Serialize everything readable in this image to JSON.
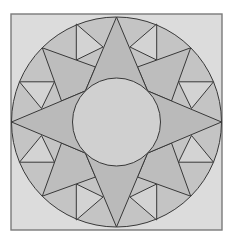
{
  "diagram": {
    "colors": {
      "page_background": "#ffffff",
      "square_fill": "#dcdcdc",
      "square_border": "#7a7a7a",
      "outer_ring_fill": "#c4c4c4",
      "star_point_fill": "#bababa",
      "secondary_point_fill": "#bdbdbd",
      "tertiary_point_fill": "#d3d3d3",
      "center_circle_fill": "#d0d0d0",
      "line": "#383838"
    },
    "square": {
      "x": 11,
      "y": 14,
      "width": 211,
      "height": 216
    },
    "outer_circle": {
      "cx": 116.5,
      "cy": 122,
      "r": 105
    },
    "center_circle": {
      "cx": 116.5,
      "cy": 122,
      "r": 44
    },
    "main_points": [
      {
        "name": "north",
        "points": [
          [
            116.5,
            17
          ],
          [
            147.6,
            90.9
          ],
          [
            85.4,
            90.9
          ]
        ]
      },
      {
        "name": "east",
        "points": [
          [
            221.5,
            122
          ],
          [
            147.6,
            153.1
          ],
          [
            147.6,
            90.9
          ]
        ]
      },
      {
        "name": "south",
        "points": [
          [
            116.5,
            227
          ],
          [
            85.4,
            153.1
          ],
          [
            147.6,
            153.1
          ]
        ]
      },
      {
        "name": "west",
        "points": [
          [
            11.5,
            122
          ],
          [
            85.4,
            90.9
          ],
          [
            85.4,
            153.1
          ]
        ]
      }
    ],
    "secondary_points": [
      {
        "name": "northwest",
        "points": [
          [
            42.3,
            47.8
          ],
          [
            95.5,
            67
          ],
          [
            85.4,
            90.9
          ],
          [
            61.5,
            101
          ]
        ]
      },
      {
        "name": "northeast",
        "points": [
          [
            190.7,
            47.8
          ],
          [
            137.5,
            67
          ],
          [
            147.6,
            90.9
          ],
          [
            171.5,
            101
          ]
        ]
      },
      {
        "name": "southwest",
        "points": [
          [
            42.3,
            196.2
          ],
          [
            95.5,
            177
          ],
          [
            85.4,
            153.1
          ],
          [
            61.5,
            143
          ]
        ]
      },
      {
        "name": "southeast",
        "points": [
          [
            190.7,
            196.2
          ],
          [
            137.5,
            177
          ],
          [
            147.6,
            153.1
          ],
          [
            171.5,
            143
          ]
        ]
      }
    ],
    "tertiary_points": [
      {
        "name": "north-northwest",
        "points": [
          [
            76.3,
            24
          ],
          [
            76.3,
            60
          ],
          [
            103,
            47
          ]
        ]
      },
      {
        "name": "north-northeast",
        "points": [
          [
            156.7,
            24
          ],
          [
            156.7,
            60
          ],
          [
            130,
            47
          ]
        ]
      },
      {
        "name": "south-southwest",
        "points": [
          [
            76.3,
            220
          ],
          [
            76.3,
            184
          ],
          [
            103,
            197
          ]
        ]
      },
      {
        "name": "south-southeast",
        "points": [
          [
            156.7,
            220
          ],
          [
            156.7,
            184
          ],
          [
            130,
            197
          ]
        ]
      },
      {
        "name": "west-northwest",
        "points": [
          [
            19.5,
            81.8
          ],
          [
            54.5,
            81.8
          ],
          [
            41.5,
            108.5
          ]
        ]
      },
      {
        "name": "west-southwest",
        "points": [
          [
            19.5,
            162.2
          ],
          [
            54.5,
            162.2
          ],
          [
            41.5,
            135.5
          ]
        ]
      },
      {
        "name": "east-northeast",
        "points": [
          [
            213.5,
            81.8
          ],
          [
            178.5,
            81.8
          ],
          [
            191.5,
            108.5
          ]
        ]
      },
      {
        "name": "east-southeast",
        "points": [
          [
            213.5,
            162.2
          ],
          [
            178.5,
            162.2
          ],
          [
            191.5,
            135.5
          ]
        ]
      }
    ]
  }
}
